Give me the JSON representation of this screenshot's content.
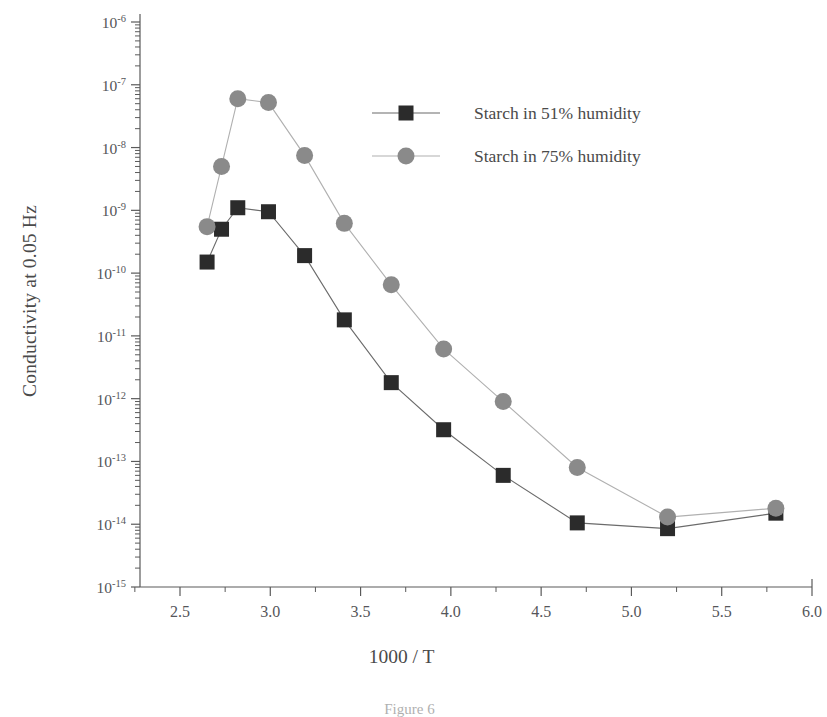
{
  "figure": {
    "caption": "Figure 6"
  },
  "chart_data": {
    "type": "scatter",
    "title": "",
    "xlabel": "1000 / T",
    "ylabel": "Conductivity at 0.05 Hz",
    "yscale": "log",
    "xlim": [
      2.25,
      6.0
    ],
    "ylim": [
      1e-15,
      1e-06
    ],
    "grid": false,
    "legend_position": "upper-center-right",
    "x_ticks": [
      "2.5",
      "3.0",
      "3.5",
      "4.0",
      "4.5",
      "5.0",
      "5.5",
      "6.0"
    ],
    "x_tick_values": [
      2.5,
      3.0,
      3.5,
      4.0,
      4.5,
      5.0,
      5.5,
      6.0
    ],
    "y_ticks": [
      "10-6",
      "10-7",
      "10-8",
      "10-9",
      "10-10",
      "10-11",
      "10-12",
      "10-13",
      "10-14",
      "10-15"
    ],
    "y_tick_bases": [
      "10",
      "10",
      "10",
      "10",
      "10",
      "10",
      "10",
      "10",
      "10",
      "10"
    ],
    "y_tick_exponents": [
      "-6",
      "-7",
      "-8",
      "-9",
      "-10",
      "-11",
      "-12",
      "-13",
      "-14",
      "-15"
    ],
    "y_tick_values": [
      1e-06,
      1e-07,
      1e-08,
      1e-09,
      1e-10,
      1e-11,
      1e-12,
      1e-13,
      1e-14,
      1e-15
    ],
    "series": [
      {
        "name": "Starch in 51% humidity",
        "marker": "square",
        "color": "#2b2b2b",
        "line_color": "#6b6b6b",
        "x": [
          2.65,
          2.73,
          2.82,
          2.99,
          3.19,
          3.41,
          3.67,
          3.96,
          4.29,
          4.7,
          5.2,
          5.8
        ],
        "y": [
          1.5e-10,
          5e-10,
          1.1e-09,
          9.5e-10,
          1.9e-10,
          1.8e-11,
          1.8e-12,
          3.2e-13,
          6e-14,
          1.05e-14,
          8.5e-15,
          1.5e-14
        ]
      },
      {
        "name": "Starch in 75% humidity",
        "marker": "circle",
        "color": "#8a8a8a",
        "line_color": "#b0b0b0",
        "x": [
          2.65,
          2.73,
          2.82,
          2.99,
          3.19,
          3.41,
          3.67,
          3.96,
          4.29,
          4.7,
          5.2,
          5.8
        ],
        "y": [
          5.5e-10,
          5e-09,
          6e-08,
          5.2e-08,
          7.5e-09,
          6.2e-10,
          6.5e-11,
          6.2e-12,
          9e-13,
          8e-14,
          1.3e-14,
          1.8e-14
        ]
      }
    ],
    "legend": [
      {
        "label": "Starch in 51% humidity",
        "marker": "square",
        "color": "#2b2b2b"
      },
      {
        "label": "Starch in 75% humidity",
        "marker": "circle",
        "color": "#8a8a8a"
      }
    ]
  }
}
